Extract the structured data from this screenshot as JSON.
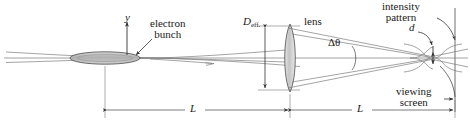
{
  "figure": {
    "type": "optics-schematic",
    "title_visible": "",
    "labels": {
      "y_axis": "y",
      "electron_bunch": "electron\nbunch",
      "electron_bunch_line1": "electron",
      "electron_bunch_line2": "bunch",
      "d_eff_symbol": "D",
      "d_eff_subscript": "eff.",
      "lens": "lens",
      "delta_theta": "Δθ",
      "d_spacing": "d",
      "intensity_pattern_line1": "intensity",
      "intensity_pattern_line2": "pattern",
      "viewing_screen_line1": "viewing",
      "viewing_screen_line2": "screen",
      "distance_left": "L",
      "distance_right": "L"
    },
    "colors": {
      "ink": "#1a1a1a",
      "line": "#555555",
      "ray": "#777777",
      "bunch_fill": "#b9b9b9",
      "lens_fill": "#c9c9c9",
      "background": "#ffffff"
    },
    "geometry": {
      "axis_y": 58,
      "bunch_x": 105,
      "lens_x": 290,
      "screen_x": 455,
      "dimension_line_y": 110,
      "d_eff_top": 26,
      "d_eff_bottom": 90
    }
  }
}
